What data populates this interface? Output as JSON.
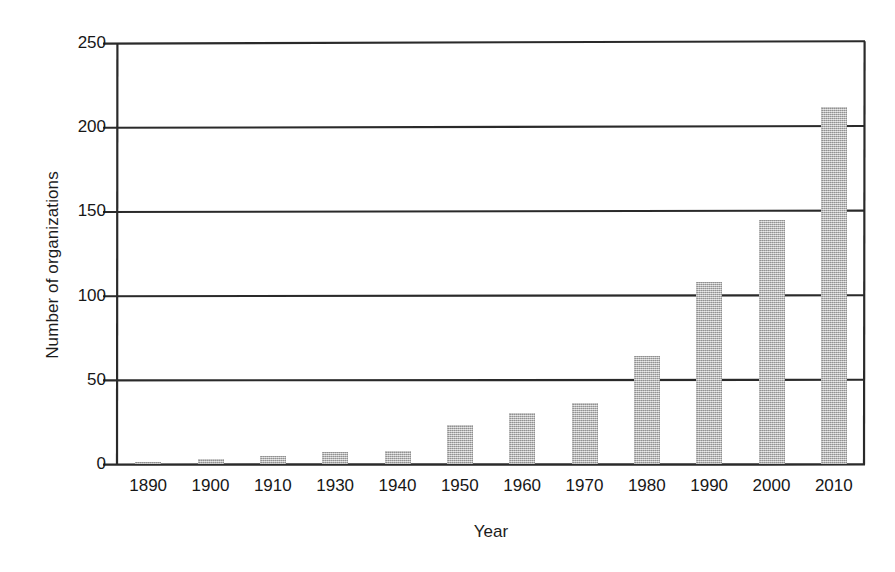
{
  "chart_data": {
    "type": "bar",
    "title": "",
    "xlabel": "Year",
    "ylabel": "Number of organizations",
    "categories": [
      "1890",
      "1900",
      "1910",
      "1930",
      "1940",
      "1950",
      "1960",
      "1970",
      "1980",
      "1990",
      "2000",
      "2010"
    ],
    "values": [
      1,
      3,
      5,
      7,
      8,
      23,
      30,
      36,
      64,
      108,
      145,
      212
    ],
    "ylim": [
      0,
      250
    ],
    "yticks": [
      0,
      50,
      100,
      150,
      200,
      250
    ],
    "ytick_labels": [
      "0",
      "50",
      "100",
      "150",
      "200",
      "250"
    ],
    "xlim_note": "categorical",
    "grid": "horizontal",
    "legend": "none",
    "bar_color": "#aaaaaa",
    "axis_color": "#1a1a1a",
    "background_color": "#ffffff"
  }
}
